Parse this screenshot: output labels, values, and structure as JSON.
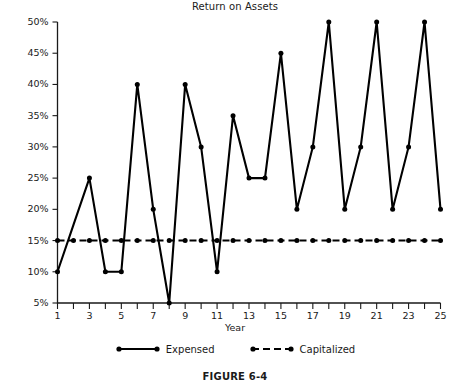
{
  "chart_data": {
    "type": "line",
    "title": "Return on Assets",
    "xlabel": "Year",
    "ylabel": "",
    "xlim": [
      1,
      25
    ],
    "ylim": [
      5,
      50
    ],
    "grid": false,
    "legend_position": "bottom",
    "x": [
      1,
      2,
      3,
      4,
      5,
      6,
      7,
      8,
      9,
      10,
      11,
      12,
      13,
      14,
      15,
      16,
      17,
      18,
      19,
      20,
      21,
      22,
      23,
      24,
      25
    ],
    "xtick_labels": [
      "1",
      "3",
      "5",
      "7",
      "9",
      "11",
      "13",
      "15",
      "17",
      "19",
      "21",
      "23",
      "25"
    ],
    "xtick_values": [
      1,
      3,
      5,
      7,
      9,
      11,
      13,
      15,
      17,
      19,
      21,
      23,
      25
    ],
    "ytick_labels": [
      "5%",
      "10%",
      "15%",
      "20%",
      "25%",
      "30%",
      "35%",
      "40%",
      "45%",
      "50%"
    ],
    "ytick_values": [
      5,
      10,
      15,
      20,
      25,
      30,
      35,
      40,
      45,
      50
    ],
    "series": [
      {
        "name": "Expensed",
        "style": "solid",
        "color": "#000000",
        "values": [
          10,
          17.5,
          25,
          10,
          10,
          40,
          20,
          5,
          40,
          30,
          10,
          35,
          25,
          25,
          45,
          20,
          30,
          50,
          20,
          30,
          50,
          20,
          30,
          50,
          20
        ]
      },
      {
        "name": "Capitalized",
        "style": "dashed",
        "color": "#000000",
        "values": [
          15,
          15,
          15,
          15,
          15,
          15,
          15,
          15,
          15,
          15,
          15,
          15,
          15,
          15,
          15,
          15,
          15,
          15,
          15,
          15,
          15,
          15,
          15,
          15,
          15
        ]
      }
    ]
  },
  "figure": {
    "caption": "FIGURE 6-4"
  },
  "legend": {
    "entries": [
      {
        "label": "Expensed"
      },
      {
        "label": "Capitalized"
      }
    ]
  }
}
